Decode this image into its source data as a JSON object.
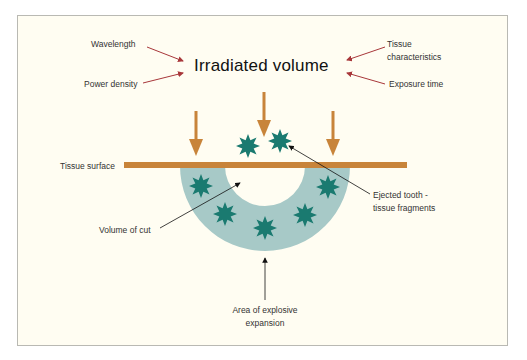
{
  "title": "Irradiated volume",
  "factors": {
    "wavelength": "Wavelength",
    "power_density": "Power density",
    "tissue_line1": "Tissue",
    "tissue_line2": "characteristics",
    "exposure_time": "Exposure time"
  },
  "labels": {
    "tissue_surface": "Tissue surface",
    "volume_of_cut": "Volume of cut",
    "ejected_line1": "Ejected tooth -",
    "ejected_line2": "tissue fragments",
    "explosive_line1": "Area of explosive",
    "explosive_line2": "expansion"
  },
  "colors": {
    "background": "#fffdf2",
    "frame_border": "#b9b9b3",
    "beam_orange": "#c8843a",
    "factor_arrow_red": "#a8373a",
    "zone_teal_light": "#a7c9c7",
    "fragment_teal": "#1a7a70",
    "pointer_black": "#111111"
  }
}
